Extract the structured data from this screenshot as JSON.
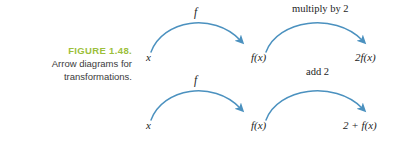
{
  "figure": {
    "number_label": "FIGURE 1.48.",
    "caption_line_1": "Arrow diagrams for",
    "caption_line_2": "transformations.",
    "accent_color": "#9cbf3b",
    "arrow_color": "#4b91bf",
    "background_color": "#ffffff"
  },
  "diagrams": {
    "row_1": {
      "start_label": "x",
      "arc_1_label": "f",
      "middle_label": "f(x)",
      "arc_2_label": "multiply by 2",
      "end_label": "2f(x)"
    },
    "row_2": {
      "start_label": "x",
      "arc_1_label": "f",
      "middle_label": "f(x)",
      "arc_2_label": "add 2",
      "end_label": "2 + f(x)"
    }
  }
}
